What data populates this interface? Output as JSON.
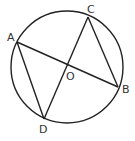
{
  "diagram": {
    "type": "circle-geometry",
    "circle": {
      "center": "O",
      "cx": 67,
      "cy": 67,
      "r": 56
    },
    "points": [
      {
        "label": "A",
        "x": 17,
        "y": 42
      },
      {
        "label": "B",
        "x": 118,
        "y": 87
      },
      {
        "label": "C",
        "x": 88,
        "y": 17
      },
      {
        "label": "D",
        "x": 44,
        "y": 119
      },
      {
        "label": "O",
        "x": 66,
        "y": 64
      }
    ],
    "segments": [
      "AB",
      "CD",
      "AD",
      "CB"
    ],
    "labels": {
      "A": "A",
      "B": "B",
      "C": "C",
      "D": "D",
      "O": "O"
    },
    "stroke_color": "#222222"
  }
}
